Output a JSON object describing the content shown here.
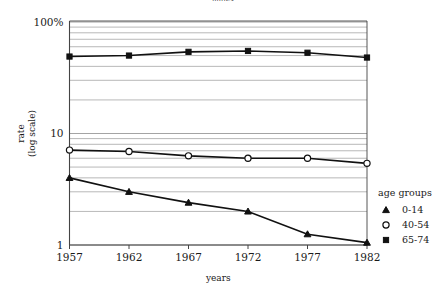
{
  "figure": {
    "clipped_title": "mules",
    "background_color": "#ffffff",
    "line_color": "#111111",
    "grid_color": "#9a9a9a",
    "axis_color": "#444444"
  },
  "chart_data": {
    "type": "line",
    "title": "",
    "xlabel": "years",
    "ylabel": "rate\n(log scale)",
    "ylabel_line1": "rate",
    "ylabel_line2": "(log scale)",
    "x": [
      1957,
      1962,
      1967,
      1972,
      1977,
      1982
    ],
    "categories": [
      "1957",
      "1962",
      "1967",
      "1972",
      "1977",
      "1982"
    ],
    "xlim": [
      1957,
      1982
    ],
    "ylim": [
      1,
      100
    ],
    "yscale": "log",
    "grid": true,
    "grid_minor": true,
    "ytick_labels": [
      "100%",
      "10",
      "1"
    ],
    "ytick_values": [
      100,
      10,
      1
    ],
    "yminor_values": [
      90,
      80,
      70,
      60,
      50,
      40,
      30,
      20,
      9,
      8,
      7,
      6,
      5,
      4,
      3,
      2
    ],
    "legend_position": "right",
    "legend_title": "age groups",
    "series": [
      {
        "name": "0-14",
        "marker": "triangle",
        "marker_filled": true,
        "values": [
          4.0,
          3.0,
          2.4,
          2.0,
          1.25,
          1.05
        ]
      },
      {
        "name": "40-54",
        "marker": "circle",
        "marker_filled": false,
        "values": [
          7.1,
          6.9,
          6.3,
          6.0,
          6.0,
          5.4
        ]
      },
      {
        "name": "65-74",
        "marker": "square",
        "marker_filled": true,
        "values": [
          49,
          50,
          54,
          55,
          53,
          48
        ]
      }
    ]
  },
  "legend": {
    "title": "age groups",
    "items": [
      {
        "marker": "triangle",
        "label": "0-14"
      },
      {
        "marker": "circle",
        "label": "40-54"
      },
      {
        "marker": "square",
        "label": "65-74"
      }
    ]
  },
  "axes": {
    "x_axis_title": "years",
    "y_axis_title_line1": "rate",
    "y_axis_title_line2": "(log scale)",
    "x_ticks": [
      "1957",
      "1962",
      "1967",
      "1972",
      "1977",
      "1982"
    ],
    "y_ticks": [
      "100%",
      "10",
      "1"
    ]
  }
}
